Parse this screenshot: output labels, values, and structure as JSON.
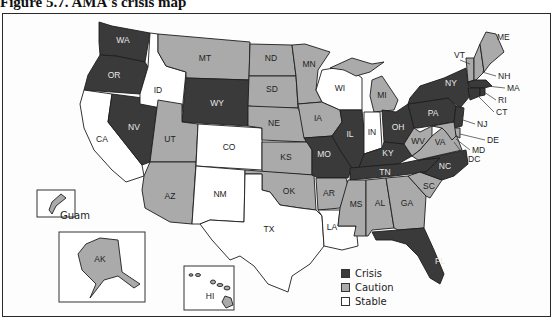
{
  "figure": {
    "title": "Figure 5.7.   AMA's crisis map"
  },
  "colors": {
    "crisis": "#3a3a3a",
    "caution": "#aaaaaa",
    "stable": "#ffffff",
    "crisis_label": "#e8e8e8",
    "caution_label": "#222222",
    "stable_label": "#222222"
  },
  "legend": {
    "items": [
      {
        "key": "crisis",
        "label": "Crisis"
      },
      {
        "key": "caution",
        "label": "Caution"
      },
      {
        "key": "stable",
        "label": "Stable"
      }
    ]
  },
  "insets": {
    "guam": "Guam",
    "alaska": "AK",
    "hawaii": "HI"
  },
  "states": {
    "WA": "crisis",
    "OR": "crisis",
    "CA": "stable",
    "NV": "crisis",
    "ID": "stable",
    "MT": "caution",
    "WY": "crisis",
    "UT": "caution",
    "AZ": "caution",
    "CO": "stable",
    "NM": "stable",
    "ND": "caution",
    "SD": "caution",
    "NE": "caution",
    "KS": "caution",
    "OK": "caution",
    "TX": "stable",
    "MN": "caution",
    "IA": "caution",
    "MO": "crisis",
    "AR": "caution",
    "LA": "stable",
    "WI": "stable",
    "IL": "crisis",
    "MI": "caution",
    "IN": "stable",
    "OH": "crisis",
    "KY": "crisis",
    "TN": "crisis",
    "MS": "caution",
    "AL": "caution",
    "GA": "caution",
    "FL": "crisis",
    "SC": "caution",
    "NC": "crisis",
    "VA": "caution",
    "WV": "caution",
    "PA": "crisis",
    "NY": "crisis",
    "VT": "caution",
    "NH": "caution",
    "ME": "caution",
    "MA": "crisis",
    "RI": "crisis",
    "CT": "crisis",
    "NJ": "crisis",
    "DE": "caution",
    "MD": "caution",
    "DC": "caution",
    "AK": "caution",
    "HI": "caution",
    "Guam": "caution"
  },
  "chart_data": {
    "type": "choropleth",
    "title": "AMA's crisis map",
    "legend": [
      "Crisis",
      "Caution",
      "Stable"
    ],
    "legend_position": "bottom-right",
    "categories": {
      "Crisis": [
        "WA",
        "OR",
        "NV",
        "WY",
        "MO",
        "IL",
        "OH",
        "KY",
        "TN",
        "FL",
        "NC",
        "PA",
        "NY",
        "MA",
        "RI",
        "CT",
        "NJ"
      ],
      "Caution": [
        "MT",
        "UT",
        "AZ",
        "ND",
        "SD",
        "NE",
        "KS",
        "OK",
        "MN",
        "IA",
        "AR",
        "MI",
        "MS",
        "AL",
        "GA",
        "SC",
        "VA",
        "WV",
        "VT",
        "NH",
        "ME",
        "DE",
        "MD",
        "DC",
        "AK",
        "HI",
        "Guam"
      ],
      "Stable": [
        "CA",
        "ID",
        "CO",
        "NM",
        "TX",
        "LA",
        "WI",
        "IN"
      ]
    }
  }
}
